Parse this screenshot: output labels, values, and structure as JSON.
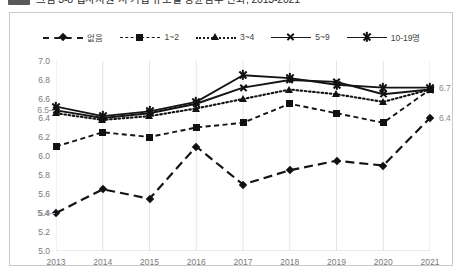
{
  "caption": {
    "chip_label": "",
    "text": "그림  3-8   입사지원 시 기업 규모별 평균점수 변화, 2013-2021"
  },
  "legend": {
    "position": "top-center",
    "items": [
      {
        "label": "없음",
        "marker": "diamond",
        "line": "dash-lg"
      },
      {
        "label": "1~2",
        "marker": "square",
        "line": "dash-sm"
      },
      {
        "label": "3~4",
        "marker": "triangle",
        "line": "dotted"
      },
      {
        "label": "5~9",
        "marker": "x",
        "line": "solid"
      },
      {
        "label": "10-19명",
        "marker": "star",
        "line": "solid"
      }
    ]
  },
  "axes": {
    "y_ticks": [
      "7.0",
      "6.8",
      "6.6",
      "6.4",
      "6.2",
      "6.0",
      "5.8",
      "5.6",
      "5.4",
      "5.2",
      "5.0"
    ],
    "x_ticks": [
      "2013",
      "2014",
      "2015",
      "2016",
      "2017",
      "2018",
      "2019",
      "2020",
      "2021"
    ]
  },
  "annotations": [
    {
      "text": "6.5",
      "series": "5~9",
      "year": "2013",
      "side": "left"
    },
    {
      "text": "5.4",
      "series": "없음",
      "year": "2013",
      "side": "left"
    },
    {
      "text": "6.7",
      "series": "10-19명",
      "year": "2021",
      "side": "right"
    },
    {
      "text": "6.4",
      "series": "없음",
      "year": "2021",
      "side": "right"
    }
  ],
  "chart_data": {
    "type": "line",
    "title": "입사지원 시 기업 규모별 평균점수 변화, 2013-2021",
    "xlabel": "",
    "ylabel": "",
    "x": [
      "2013",
      "2014",
      "2015",
      "2016",
      "2017",
      "2018",
      "2019",
      "2020",
      "2021"
    ],
    "ylim": [
      5.0,
      7.0
    ],
    "ytick_step": 0.2,
    "grid": "vertical",
    "legend_position": "top-center",
    "series": [
      {
        "name": "없음",
        "marker": "diamond",
        "dash": "long",
        "values": [
          5.4,
          5.65,
          5.55,
          6.1,
          5.7,
          5.85,
          5.95,
          5.9,
          6.4
        ]
      },
      {
        "name": "1~2",
        "marker": "square",
        "dash": "short",
        "values": [
          6.1,
          6.25,
          6.2,
          6.3,
          6.35,
          6.55,
          6.45,
          6.35,
          6.7
        ]
      },
      {
        "name": "3~4",
        "marker": "triangle",
        "dash": "dot",
        "values": [
          6.45,
          6.38,
          6.42,
          6.5,
          6.6,
          6.7,
          6.65,
          6.57,
          6.7
        ]
      },
      {
        "name": "5~9",
        "marker": "x",
        "dash": "solid",
        "values": [
          6.48,
          6.4,
          6.45,
          6.55,
          6.72,
          6.8,
          6.78,
          6.65,
          6.7
        ]
      },
      {
        "name": "10-19명",
        "marker": "star",
        "dash": "solid",
        "values": [
          6.52,
          6.42,
          6.47,
          6.57,
          6.85,
          6.82,
          6.75,
          6.72,
          6.72
        ]
      }
    ]
  }
}
